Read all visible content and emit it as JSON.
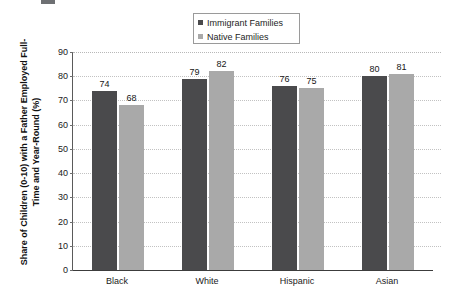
{
  "chart_data": {
    "type": "bar",
    "title": "",
    "xlabel": "",
    "ylabel": "Share of Children (0-10) with a Father Employed Full- Time and Year-Round (%)",
    "ylim": [
      0,
      90
    ],
    "ytick_step": 10,
    "yticks": [
      "90",
      "80",
      "70",
      "60",
      "50",
      "40",
      "30",
      "20",
      "10",
      "0"
    ],
    "grid": true,
    "legend_position": "top-center",
    "categories": [
      "Black",
      "White",
      "Hispanic",
      "Asian"
    ],
    "series": [
      {
        "name": "Immigrant Families",
        "color": "#4a4a4c",
        "values": [
          74,
          79,
          76,
          80
        ]
      },
      {
        "name": "Native Families",
        "color": "#a9a9a9",
        "values": [
          68,
          82,
          75,
          81
        ]
      }
    ]
  },
  "legend": {
    "entries": [
      {
        "label": "Immigrant Families",
        "marker": "square-marker-dark"
      },
      {
        "label": "Native Families",
        "marker": "square-marker-light"
      }
    ]
  }
}
